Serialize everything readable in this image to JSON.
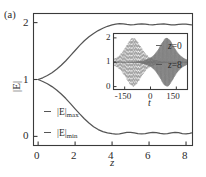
{
  "panel": {
    "label": "(a)"
  },
  "chart_data": {
    "type": "line",
    "title": "",
    "xlabel": "z",
    "ylabel": "|E|",
    "xlim": [
      -0.25,
      8.35
    ],
    "ylim": [
      -0.16,
      2.16
    ],
    "xticks": [
      "0",
      "2",
      "4",
      "6",
      "8"
    ],
    "xtick_values": [
      0,
      2,
      4,
      6,
      8
    ],
    "yticks": [
      "0",
      "1",
      "2"
    ],
    "ytick_values": [
      0,
      1,
      2
    ],
    "grid": false,
    "legend_position": "lower-left-inside",
    "series": [
      {
        "name": "|E|max",
        "label_base": "|E|",
        "label_sub": "max",
        "color": "#555555",
        "style": "solid",
        "x": [
          0,
          0.25,
          0.5,
          0.75,
          1.0,
          1.25,
          1.5,
          1.75,
          2.0,
          2.25,
          2.5,
          2.75,
          3.0,
          3.25,
          3.5,
          3.75,
          4.0,
          4.2,
          4.4,
          4.6,
          4.8,
          5.0,
          5.2,
          5.4,
          5.6,
          5.8,
          6.0,
          6.2,
          6.4,
          6.6,
          6.8,
          7.0,
          7.2,
          7.4,
          7.6,
          7.8,
          8.0,
          8.2,
          8.3
        ],
        "y": [
          1.0,
          1.03,
          1.07,
          1.12,
          1.18,
          1.25,
          1.33,
          1.42,
          1.51,
          1.6,
          1.68,
          1.75,
          1.81,
          1.86,
          1.9,
          1.935,
          1.96,
          1.975,
          1.982,
          1.978,
          1.968,
          1.962,
          1.966,
          1.974,
          1.978,
          1.972,
          1.963,
          1.961,
          1.967,
          1.975,
          1.977,
          1.97,
          1.962,
          1.962,
          1.969,
          1.975,
          1.973,
          1.966,
          1.962
        ]
      },
      {
        "name": "|E|min",
        "label_base": "|E|",
        "label_sub": "min",
        "color": "#555555",
        "style": "solid",
        "x": [
          0,
          0.25,
          0.5,
          0.75,
          1.0,
          1.25,
          1.5,
          1.75,
          2.0,
          2.25,
          2.5,
          2.75,
          3.0,
          3.25,
          3.5,
          3.75,
          4.0,
          4.2,
          4.4,
          4.6,
          4.8,
          5.0,
          5.2,
          5.4,
          5.6,
          5.8,
          6.0,
          6.2,
          6.4,
          6.6,
          6.8,
          7.0,
          7.2,
          7.4,
          7.6,
          7.8,
          8.0,
          8.2,
          8.3
        ],
        "y": [
          1.0,
          0.965,
          0.925,
          0.875,
          0.815,
          0.745,
          0.665,
          0.575,
          0.485,
          0.395,
          0.31,
          0.235,
          0.17,
          0.12,
          0.085,
          0.062,
          0.048,
          0.042,
          0.045,
          0.058,
          0.07,
          0.072,
          0.063,
          0.05,
          0.043,
          0.048,
          0.062,
          0.072,
          0.068,
          0.053,
          0.043,
          0.047,
          0.061,
          0.071,
          0.066,
          0.05,
          0.043,
          0.052,
          0.062
        ]
      }
    ],
    "inset": {
      "type": "line",
      "xlabel": "t",
      "ylabel": "",
      "xlim": [
        -215,
        215
      ],
      "ylim": [
        -0.12,
        2.18
      ],
      "xticks": [
        "-150",
        "0",
        "150"
      ],
      "xtick_values": [
        -150,
        0,
        150
      ],
      "yticks": [
        "0",
        "1",
        "2"
      ],
      "ytick_values": [
        0,
        1,
        2
      ],
      "grid": false,
      "legend_position": "top-right-inside",
      "baseline": 1,
      "series": [
        {
          "name": "z = 0",
          "var": "z",
          "eq": "=",
          "value": "0",
          "color": "#8a8a8a",
          "style": "dashed",
          "packet_center": -100,
          "packet_width": 42,
          "peak": 2.0,
          "trough": 0.0
        },
        {
          "name": "z = 8",
          "var": "z",
          "eq": "=",
          "value": "8",
          "color": "#6a6a6a",
          "style": "solid",
          "packet_center": 95,
          "packet_width": 40,
          "peak": 2.0,
          "trough": 0.0
        }
      ]
    }
  }
}
